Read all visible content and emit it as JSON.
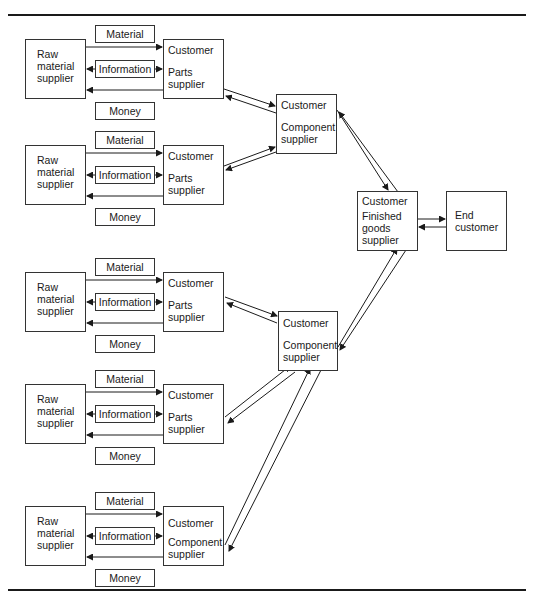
{
  "diagram": {
    "flow_labels": {
      "material": "Material",
      "information": "Information",
      "money": "Money"
    },
    "tier3": [
      {
        "raw": "Raw\nmaterial\nsupplier",
        "customer": "Customer",
        "role": "Parts\nsupplier"
      },
      {
        "raw": "Raw\nmaterial\nsupplier",
        "customer": "Customer",
        "role": "Parts\nsupplier"
      },
      {
        "raw": "Raw\nmaterial\nsupplier",
        "customer": "Customer",
        "role": "Parts\nsupplier"
      },
      {
        "raw": "Raw\nmaterial\nsupplier",
        "customer": "Customer",
        "role": "Parts\nsupplier"
      },
      {
        "raw": "Raw\nmaterial\nsupplier",
        "customer": "Customer",
        "role": "Component\nsupplier"
      }
    ],
    "tier2": [
      {
        "customer": "Customer",
        "role": "Component\nsupplier"
      },
      {
        "customer": "Customer",
        "role": "Component\nsupplier"
      }
    ],
    "tier1": {
      "customer": "Customer",
      "role": "Finished\ngoods\nsupplier"
    },
    "end": {
      "label": "End\ncustomer"
    }
  }
}
